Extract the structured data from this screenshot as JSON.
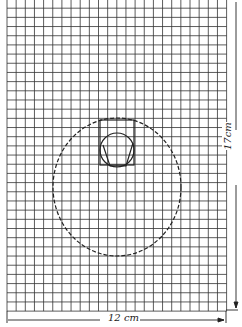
{
  "diagram": {
    "width_label": "12 cm",
    "height_label": "17cm",
    "grid": {
      "cols": 24,
      "rows": 34,
      "left": 7,
      "top": -1,
      "cell_w": 9.15,
      "cell_h": 9.18,
      "color": "#333333"
    },
    "dashed_circle": {
      "cx": 117,
      "cy": 187,
      "rx": 64,
      "ry": 69
    },
    "rectangle": {
      "x": 100,
      "y": 120,
      "w": 34,
      "h": 45
    },
    "inner_circle": {
      "cx": 117,
      "cy": 150,
      "r": 17
    }
  }
}
